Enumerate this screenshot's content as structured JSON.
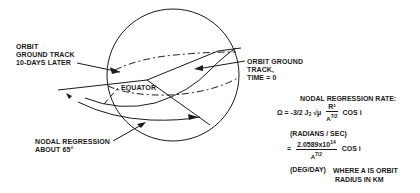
{
  "diagram": {
    "labels": {
      "orbit_later": [
        "ORBIT",
        "GROUND TRACK",
        "10-DAYS LATER"
      ],
      "orbit_now": [
        "ORBIT GROUND",
        "TRACK,",
        "TIME = 0"
      ],
      "equator": "EQUATOR",
      "nodal_regression": [
        "NODAL  REGRESSION",
        "ABOUT 65°"
      ]
    },
    "formula": {
      "title": "NODAL REGRESSION RATE:",
      "line1_lhs": "Ω = -3/2 J",
      "line1_j_sub": "2",
      "line1_sqrt": "√μ",
      "line1_num": "R²",
      "line1_den": "A",
      "line1_den_exp": "7/2",
      "line1_trail": "COS i",
      "units1": "(RADIANS / SEC)",
      "line2_eq": "=",
      "line2_num": "2.0589x10",
      "line2_num_exp": "14",
      "line2_den": "A",
      "line2_den_exp": "7/2",
      "line2_trail": "COS i",
      "units2": "(DEG/DAY)",
      "note": [
        "WHERE  A   IS ORBIT",
        "RADIUS IN KM"
      ]
    },
    "colors": {
      "ink": "#1a1a1a",
      "background": "#ffffff"
    }
  }
}
